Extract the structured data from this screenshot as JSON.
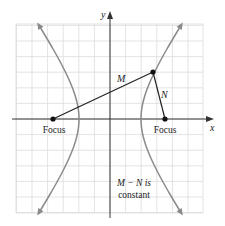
{
  "figure": {
    "axes": {
      "x_label": "x",
      "y_label": "y"
    },
    "labels": {
      "left_focus": "Focus",
      "right_focus": "Focus",
      "segment_m": "M",
      "segment_n": "N",
      "note_line1": "M − N is",
      "note_line2": "constant"
    },
    "colors": {
      "grid": "#dcdcdc",
      "axis": "#333333",
      "hyperbola": "#8a8a8a",
      "segment": "#222222",
      "point": "#111111"
    },
    "geometry": {
      "grid_left": 16,
      "grid_right": 203,
      "grid_top": 24,
      "grid_bottom": 213,
      "grid_step": 15.6,
      "origin_x": 110,
      "origin_y": 119,
      "left_focus": [
        53,
        119
      ],
      "right_focus": [
        165,
        119
      ],
      "point_on_curve": [
        153,
        72
      ],
      "vertex_offset": 31
    }
  }
}
